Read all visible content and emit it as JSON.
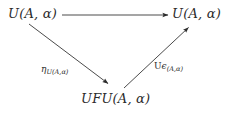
{
  "diagram": {
    "type": "commutative-triangle",
    "background_color": "#ffffff",
    "ink_color": "#2b2b2b",
    "nodes": [
      {
        "id": "top-left",
        "label": "U(A, α)",
        "x": 32,
        "y": 14
      },
      {
        "id": "top-right",
        "label": "U(A, α)",
        "x": 196,
        "y": 14
      },
      {
        "id": "bottom",
        "label": "UFU(A, α)",
        "x": 115,
        "y": 99
      }
    ],
    "arrows": [
      {
        "id": "top-horizontal",
        "from": "top-left",
        "to": "top-right",
        "label": "",
        "x1": 62,
        "y1": 15,
        "x2": 170,
        "y2": 15
      },
      {
        "id": "left-diagonal",
        "from": "top-left",
        "to": "bottom",
        "label_text": "η",
        "label_sub": "U(A,α)",
        "label_x": 41,
        "label_y": 70,
        "x1": 29,
        "y1": 24,
        "x2": 110,
        "y2": 85
      },
      {
        "id": "right-diagonal",
        "from": "bottom",
        "to": "top-right",
        "label_prefix": "U",
        "label_text": "ϵ",
        "label_sub": "(A,α)",
        "label_x": 154,
        "label_y": 67,
        "x1": 124,
        "y1": 88,
        "x2": 190,
        "y2": 26
      }
    ]
  }
}
